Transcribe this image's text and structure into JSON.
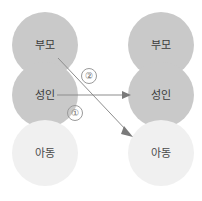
{
  "diagram": {
    "columns": [
      {
        "name": "left-person",
        "states": [
          {
            "label": "부모",
            "shade": "dark",
            "role": "parent"
          },
          {
            "label": "성인",
            "shade": "dark",
            "role": "adult"
          },
          {
            "label": "아동",
            "shade": "light",
            "role": "child"
          }
        ]
      },
      {
        "name": "right-person",
        "states": [
          {
            "label": "부모",
            "shade": "dark",
            "role": "parent"
          },
          {
            "label": "성인",
            "shade": "dark",
            "role": "adult"
          },
          {
            "label": "아동",
            "shade": "light",
            "role": "child"
          }
        ]
      }
    ],
    "arrows": [
      {
        "id": "arrow-1",
        "badge": "①",
        "from": "left-adult",
        "to": "right-adult",
        "kind": "horizontal"
      },
      {
        "id": "arrow-2",
        "badge": "②",
        "from": "left-parent",
        "to": "right-child",
        "kind": "diagonal"
      }
    ],
    "colors": {
      "circle_dark": "#c9c9c9",
      "circle_light": "#f0f0f0",
      "arrow": "#8d8d8d",
      "text": "#3c3c3c",
      "background": "#ffffff"
    }
  }
}
